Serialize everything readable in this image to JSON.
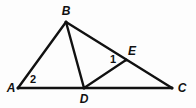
{
  "figure": {
    "width": 196,
    "height": 108,
    "background_color": "#fdfdfd",
    "stroke_color": "#111111",
    "label_color": "#111111",
    "points": {
      "A": {
        "x": 18,
        "y": 88
      },
      "B": {
        "x": 66,
        "y": 22
      },
      "C": {
        "x": 172,
        "y": 88
      },
      "D": {
        "x": 84,
        "y": 88
      },
      "E": {
        "x": 126,
        "y": 60
      }
    },
    "segments": [
      {
        "name": "segment-AC",
        "from": "A",
        "to": "C",
        "width": 2.6
      },
      {
        "name": "segment-AB",
        "from": "A",
        "to": "B",
        "width": 2.4
      },
      {
        "name": "segment-BC",
        "from": "B",
        "to": "C",
        "width": 2.4
      },
      {
        "name": "segment-BD",
        "from": "B",
        "to": "D",
        "width": 2.4
      },
      {
        "name": "segment-DE",
        "from": "D",
        "to": "E",
        "width": 2.2
      }
    ],
    "vertex_labels": [
      {
        "name": "vertex-label-A",
        "text": "A",
        "x": 11,
        "y": 88
      },
      {
        "name": "vertex-label-B",
        "text": "B",
        "x": 66,
        "y": 11
      },
      {
        "name": "vertex-label-C",
        "text": "C",
        "x": 182,
        "y": 88
      },
      {
        "name": "vertex-label-D",
        "text": "D",
        "x": 84,
        "y": 99
      },
      {
        "name": "vertex-label-E",
        "text": "E",
        "x": 132,
        "y": 51
      }
    ],
    "angle_labels": [
      {
        "name": "angle-label-1",
        "text": "1",
        "x": 113,
        "y": 59
      },
      {
        "name": "angle-label-2",
        "text": "2",
        "x": 33,
        "y": 79
      }
    ]
  }
}
